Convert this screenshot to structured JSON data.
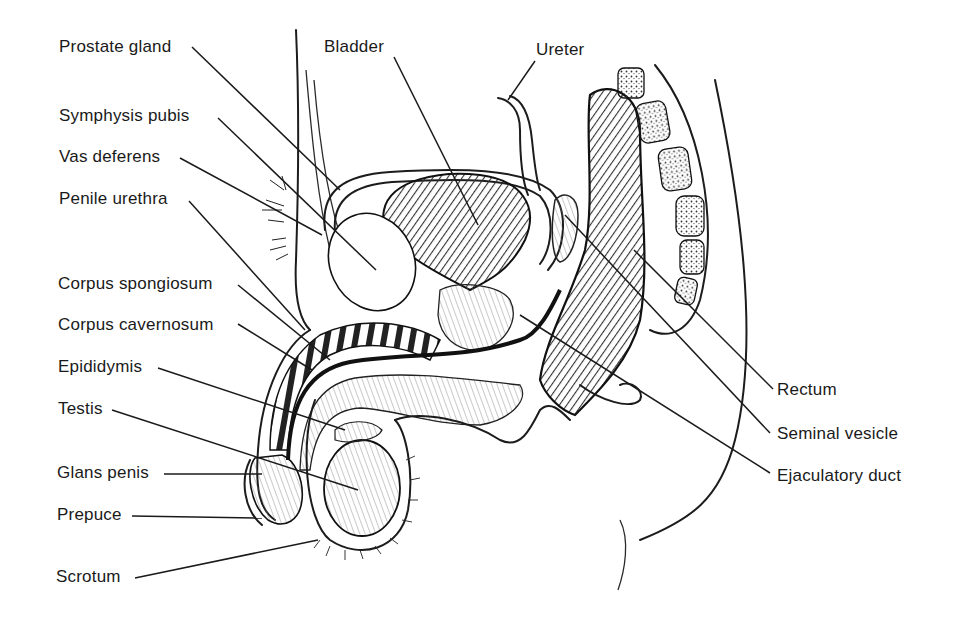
{
  "figure": {
    "background": "#ffffff",
    "ink_color": "#1a1a1a"
  },
  "labels_left": [
    {
      "id": "prostate-gland",
      "text": "Prostate gland"
    },
    {
      "id": "symphysis-pubis",
      "text": "Symphysis pubis"
    },
    {
      "id": "vas-deferens",
      "text": "Vas deferens"
    },
    {
      "id": "penile-urethra",
      "text": "Penile urethra"
    },
    {
      "id": "corpus-spongiosum",
      "text": "Corpus spongiosum"
    },
    {
      "id": "corpus-cavernosum",
      "text": "Corpus cavernosum"
    },
    {
      "id": "epididymis",
      "text": "Epididymis"
    },
    {
      "id": "testis",
      "text": "Testis"
    },
    {
      "id": "glans-penis",
      "text": "Glans penis"
    },
    {
      "id": "prepuce",
      "text": "Prepuce"
    },
    {
      "id": "scrotum",
      "text": "Scrotum"
    }
  ],
  "labels_top": [
    {
      "id": "bladder",
      "text": "Bladder"
    },
    {
      "id": "ureter",
      "text": "Ureter"
    }
  ],
  "labels_right": [
    {
      "id": "rectum",
      "text": "Rectum"
    },
    {
      "id": "seminal-vesicle",
      "text": "Seminal vesicle"
    },
    {
      "id": "ejaculatory-duct",
      "text": "Ejaculatory duct"
    }
  ]
}
